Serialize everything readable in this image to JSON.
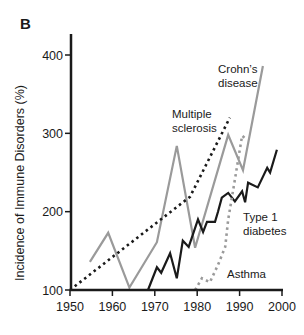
{
  "figure": {
    "panel_label": "B",
    "header_fragment": "...Journal of Medicine (2002)"
  },
  "chart_data": {
    "type": "line",
    "title": "",
    "xlabel": "",
    "ylabel": "Incidence of Immune Disorders (%)",
    "xlim": [
      1950,
      2000
    ],
    "ylim": [
      100,
      400
    ],
    "x_ticks": [
      1950,
      1960,
      1970,
      1980,
      1990,
      2000
    ],
    "y_ticks": [
      100,
      200,
      300,
      400
    ],
    "grid": false,
    "legend": "inline labels",
    "series": [
      {
        "name": "Crohn's disease",
        "label_lines": [
          "Crohn’s",
          "disease"
        ],
        "style": "solid",
        "color": "#9a9a9a",
        "label_pos": [
          218,
          73
        ],
        "x": [
          1954.7,
          1959,
          1964,
          1970.5,
          1975.2,
          1979.5,
          1987.3,
          1990.8,
          1995.5
        ],
        "y": [
          136,
          173,
          103,
          161,
          284,
          154,
          298,
          253,
          386
        ]
      },
      {
        "name": "Multiple sclerosis",
        "label_lines": [
          "Multiple",
          "sclerosis"
        ],
        "style": "dotted",
        "color": "#1a1a1a",
        "label_pos": [
          172,
          118
        ],
        "x": [
          1950,
          1978.3,
          1987.7
        ],
        "y": [
          100,
          219,
          320
        ]
      },
      {
        "name": "Type 1 diabetes",
        "label_lines": [
          "Type 1",
          "diabetes"
        ],
        "style": "solid",
        "color": "#1a1a1a",
        "label_pos": [
          243,
          221
        ],
        "x": [
          1968.4,
          1970.5,
          1971.5,
          1973.6,
          1975.2,
          1976.6,
          1978,
          1980.2,
          1981.4,
          1982.3,
          1984.2,
          1984.9,
          1985.8,
          1987.3,
          1988.9,
          1990.6,
          1991.3,
          1992,
          1994.3,
          1996.5,
          1997.2,
          1998.8
        ],
        "y": [
          100,
          129,
          122,
          147,
          115,
          163,
          155,
          190,
          174,
          187,
          187,
          200,
          218,
          224,
          213,
          226,
          212,
          237,
          231,
          256,
          250,
          279
        ]
      },
      {
        "name": "Asthma",
        "label_lines": [
          "Asthma"
        ],
        "style": "dotted",
        "color": "#9a9a9a",
        "label_pos": [
          227,
          278
        ],
        "x": [
          1979.5,
          1981.1,
          1983,
          1984.9,
          1986.6,
          1987.3,
          1988.2,
          1988.9,
          1990.6,
          1991.7
        ],
        "y": [
          100,
          115,
          110,
          132,
          155,
          190,
          219,
          241,
          297,
          292
        ]
      }
    ]
  }
}
